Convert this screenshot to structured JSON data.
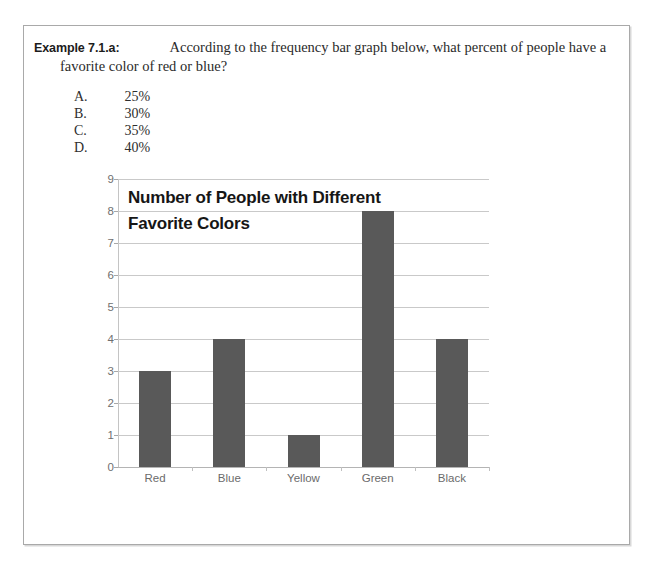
{
  "question": {
    "example_label": "Example 7.1.a:",
    "prompt_line1": "According to the frequency bar graph below, what percent of people have a",
    "prompt_line2": "favorite color of red or blue?"
  },
  "choices": [
    {
      "letter": "A.",
      "value": "25%"
    },
    {
      "letter": "B.",
      "value": "30%"
    },
    {
      "letter": "C.",
      "value": "35%"
    },
    {
      "letter": "D.",
      "value": "40%"
    }
  ],
  "chart_data": {
    "type": "bar",
    "title": "Number of People with Different Favorite Colors",
    "title_line1": "Number of People with Different",
    "title_line2": "Favorite Colors",
    "categories": [
      "Red",
      "Blue",
      "Yellow",
      "Green",
      "Black"
    ],
    "values": [
      3,
      4,
      1,
      8,
      4
    ],
    "xlabel": "",
    "ylabel": "",
    "ylim": [
      0,
      9
    ],
    "ytick_labels": [
      "0",
      "1",
      "2",
      "3",
      "4",
      "5",
      "6",
      "7",
      "8",
      "9"
    ],
    "grid": true,
    "legend": "none",
    "bar_color": "#595959",
    "gridline_color": "#c9c9c9"
  }
}
